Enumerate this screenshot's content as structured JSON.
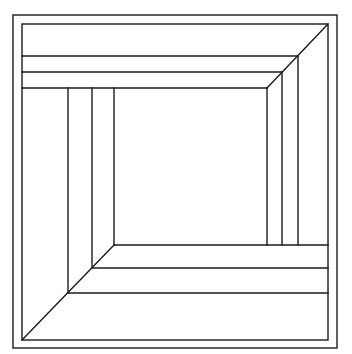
{
  "figure": {
    "stroke_color": "#1a1a1a",
    "background_color": "#ffffff",
    "outer_frame": {
      "x1": 13,
      "y1": 15,
      "x2": 337,
      "y2": 348
    },
    "inner_frame": {
      "x1": 22,
      "y1": 24,
      "x2": 328,
      "y2": 340
    },
    "top_bands": [
      {
        "y": 56,
        "x_left": 22,
        "x_right": 298
      },
      {
        "y": 72,
        "x_left": 22,
        "x_right": 282
      },
      {
        "y": 88,
        "x_left": 22,
        "x_right": 267
      }
    ],
    "right_bands": [
      {
        "x": 298,
        "y_top": 56,
        "y_bottom": 245
      },
      {
        "x": 282,
        "y_top": 72,
        "y_bottom": 245
      },
      {
        "x": 267,
        "y_top": 88,
        "y_bottom": 245
      }
    ],
    "left_bands": [
      {
        "x": 68,
        "y_top": 88,
        "y_bottom": 293
      },
      {
        "x": 92,
        "y_top": 88,
        "y_bottom": 268
      },
      {
        "x": 114,
        "y_top": 88,
        "y_bottom": 245
      }
    ],
    "bottom_bands": [
      {
        "y": 245,
        "x_left": 114,
        "x_right": 328
      },
      {
        "y": 268,
        "x_left": 92,
        "x_right": 328
      },
      {
        "y": 293,
        "x_left": 68,
        "x_right": 328
      }
    ],
    "diagonals": [
      {
        "name": "top-right-seam",
        "x1": 328,
        "y1": 24,
        "x2": 267,
        "y2": 88
      },
      {
        "name": "bottom-left-seam",
        "x1": 22,
        "y1": 340,
        "x2": 114,
        "y2": 245
      }
    ]
  }
}
